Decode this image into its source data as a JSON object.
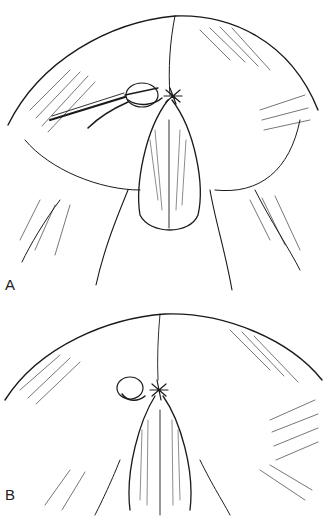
{
  "figure": {
    "panels": [
      {
        "id": "A",
        "label": "A",
        "content": "illustration-with-scalpel"
      },
      {
        "id": "B",
        "label": "B",
        "content": "illustration-closed"
      }
    ],
    "colors": {
      "line": "#1a1a1a",
      "background": "#ffffff"
    }
  }
}
